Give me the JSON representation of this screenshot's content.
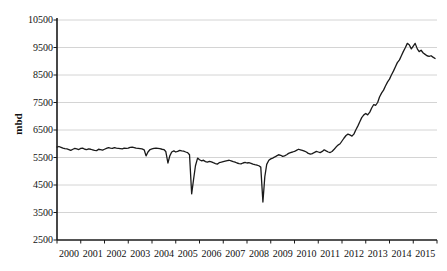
{
  "chart_data": {
    "type": "line",
    "title": "",
    "subtitle": "",
    "xlabel": "",
    "ylabel": "mbd",
    "ylim": [
      2500,
      10500
    ],
    "xlim": [
      2000,
      2016
    ],
    "grid": true,
    "legend": null,
    "y_ticks": [
      2500,
      3500,
      4500,
      5500,
      6500,
      7500,
      8500,
      9500,
      10500
    ],
    "y_tick_labels": [
      "2500",
      "3500",
      "4500",
      "5500",
      "6500",
      "7500",
      "8500",
      "9500",
      "10500"
    ],
    "x_ticks": [
      2000,
      2001,
      2002,
      2003,
      2004,
      2005,
      2006,
      2007,
      2008,
      2009,
      2010,
      2011,
      2012,
      2013,
      2014,
      2015
    ],
    "x_tick_labels": [
      "2000",
      "2001",
      "2002",
      "2003",
      "2004",
      "2005",
      "2006",
      "2007",
      "2008",
      "2009",
      "2010",
      "2011",
      "2012",
      "2013",
      "2014",
      "2015"
    ],
    "line_color": "#1a1a1a",
    "line_width": 1.3,
    "grid_color": "#c9c9c9",
    "axis_color": "#1a1a1a",
    "series": [
      {
        "name": "mbd",
        "x": [
          2000.0,
          2000.08,
          2000.17,
          2000.25,
          2000.33,
          2000.42,
          2000.5,
          2000.58,
          2000.67,
          2000.75,
          2000.83,
          2000.92,
          2001.0,
          2001.08,
          2001.17,
          2001.25,
          2001.33,
          2001.42,
          2001.5,
          2001.58,
          2001.67,
          2001.75,
          2001.83,
          2001.92,
          2002.0,
          2002.08,
          2002.17,
          2002.25,
          2002.33,
          2002.42,
          2002.5,
          2002.58,
          2002.67,
          2002.75,
          2002.83,
          2002.92,
          2003.0,
          2003.08,
          2003.17,
          2003.25,
          2003.33,
          2003.42,
          2003.5,
          2003.58,
          2003.67,
          2003.75,
          2003.83,
          2003.92,
          2004.0,
          2004.08,
          2004.17,
          2004.25,
          2004.33,
          2004.42,
          2004.5,
          2004.58,
          2004.67,
          2004.75,
          2004.83,
          2004.92,
          2005.0,
          2005.08,
          2005.17,
          2005.25,
          2005.33,
          2005.42,
          2005.5,
          2005.58,
          2005.67,
          2005.75,
          2005.83,
          2005.92,
          2006.0,
          2006.08,
          2006.17,
          2006.25,
          2006.33,
          2006.42,
          2006.5,
          2006.58,
          2006.67,
          2006.75,
          2006.83,
          2006.92,
          2007.0,
          2007.08,
          2007.17,
          2007.25,
          2007.33,
          2007.42,
          2007.5,
          2007.58,
          2007.67,
          2007.75,
          2007.83,
          2007.92,
          2008.0,
          2008.08,
          2008.17,
          2008.25,
          2008.33,
          2008.42,
          2008.5,
          2008.58,
          2008.67,
          2008.75,
          2008.83,
          2008.92,
          2009.0,
          2009.08,
          2009.17,
          2009.25,
          2009.33,
          2009.42,
          2009.5,
          2009.58,
          2009.67,
          2009.75,
          2009.83,
          2009.92,
          2010.0,
          2010.08,
          2010.17,
          2010.25,
          2010.33,
          2010.42,
          2010.5,
          2010.58,
          2010.67,
          2010.75,
          2010.83,
          2010.92,
          2011.0,
          2011.08,
          2011.17,
          2011.25,
          2011.33,
          2011.42,
          2011.5,
          2011.58,
          2011.67,
          2011.75,
          2011.83,
          2011.92,
          2012.0,
          2012.08,
          2012.17,
          2012.25,
          2012.33,
          2012.42,
          2012.5,
          2012.58,
          2012.67,
          2012.75,
          2012.83,
          2012.92,
          2013.0,
          2013.08,
          2013.17,
          2013.25,
          2013.33,
          2013.42,
          2013.5,
          2013.58,
          2013.67,
          2013.75,
          2013.83,
          2013.92,
          2014.0,
          2014.08,
          2014.17,
          2014.25,
          2014.33,
          2014.42,
          2014.5,
          2014.58,
          2014.67,
          2014.75,
          2014.83,
          2014.92,
          2015.0,
          2015.08,
          2015.17,
          2015.25,
          2015.33,
          2015.42,
          2015.5,
          2015.58,
          2015.67,
          2015.75,
          2015.83,
          2015.92
        ],
        "values": [
          5880,
          5900,
          5870,
          5840,
          5820,
          5810,
          5790,
          5760,
          5800,
          5830,
          5810,
          5790,
          5830,
          5840,
          5800,
          5790,
          5810,
          5800,
          5780,
          5760,
          5750,
          5800,
          5790,
          5770,
          5800,
          5830,
          5860,
          5840,
          5830,
          5860,
          5840,
          5830,
          5820,
          5810,
          5840,
          5830,
          5840,
          5870,
          5880,
          5860,
          5840,
          5830,
          5820,
          5810,
          5780,
          5560,
          5700,
          5790,
          5810,
          5830,
          5840,
          5830,
          5820,
          5800,
          5790,
          5720,
          5300,
          5560,
          5700,
          5740,
          5700,
          5720,
          5760,
          5740,
          5730,
          5700,
          5680,
          5600,
          4180,
          4700,
          5200,
          5480,
          5420,
          5380,
          5400,
          5350,
          5330,
          5360,
          5340,
          5310,
          5280,
          5260,
          5310,
          5330,
          5350,
          5370,
          5390,
          5400,
          5380,
          5350,
          5330,
          5300,
          5280,
          5270,
          5300,
          5320,
          5300,
          5310,
          5290,
          5260,
          5240,
          5220,
          5200,
          5150,
          3880,
          4800,
          5250,
          5400,
          5450,
          5480,
          5520,
          5560,
          5600,
          5580,
          5540,
          5560,
          5600,
          5650,
          5680,
          5700,
          5720,
          5760,
          5800,
          5780,
          5760,
          5730,
          5700,
          5650,
          5620,
          5640,
          5680,
          5720,
          5700,
          5680,
          5720,
          5780,
          5740,
          5700,
          5680,
          5720,
          5800,
          5880,
          5950,
          6000,
          6100,
          6200,
          6300,
          6350,
          6320,
          6280,
          6350,
          6500,
          6650,
          6800,
          6950,
          7050,
          7100,
          7050,
          7150,
          7300,
          7420,
          7400,
          7500,
          7700,
          7850,
          7950,
          8100,
          8250,
          8350,
          8500,
          8650,
          8800,
          8950,
          9050,
          9200,
          9350,
          9500,
          9650,
          9600,
          9450,
          9550,
          9650,
          9450,
          9350,
          9400,
          9300,
          9250,
          9200,
          9180,
          9200,
          9150,
          9100
        ]
      }
    ]
  },
  "axis": {
    "y_title": "mbd"
  }
}
